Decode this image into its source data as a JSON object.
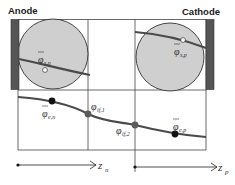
{
  "labels": {
    "anode": "Anode",
    "cathode": "Cathode"
  },
  "symbols": {
    "phi_s_n": {
      "main": "φ",
      "sub": "s,n",
      "bar": true
    },
    "phi_s_p": {
      "main": "φ",
      "sub": "s,p",
      "bar": true
    },
    "phi_e_n": {
      "main": "φ",
      "sub": "e,n",
      "bar": true
    },
    "phi_e_p": {
      "main": "φ",
      "sub": "e,p",
      "bar": true
    },
    "phi_if_1": {
      "main": "φ",
      "sub": "if,1",
      "bar": false
    },
    "phi_if_2": {
      "main": "φ",
      "sub": "if,2",
      "bar": false
    }
  },
  "axes": {
    "z_n": {
      "main": "z",
      "sub": "n"
    },
    "z_p": {
      "main": "z",
      "sub": "p"
    }
  },
  "colors": {
    "current_collector": "#555555",
    "particle_fill": "#cfcfcf",
    "particle_stroke": "#333333",
    "potential_curve": "#4a4a4a",
    "grid_line": "#444444",
    "interface_dot": "#5a5a5a",
    "average_dot": "#111111"
  }
}
